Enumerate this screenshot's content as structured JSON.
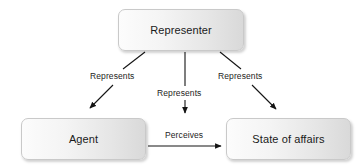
{
  "diagram": {
    "background_color": "#ffffff",
    "node_fill_start": "#fcfcfc",
    "node_fill_end": "#d9d9d9",
    "node_border_color": "#c9c9c9",
    "edge_color": "#1a1a1a",
    "text_color": "#1a1a1a",
    "nodes": [
      {
        "id": "representer",
        "label": "Representer"
      },
      {
        "id": "agent",
        "label": "Agent"
      },
      {
        "id": "state",
        "label": "State of affairs"
      }
    ],
    "edges": [
      {
        "id": "representer-agent",
        "label": "Represents",
        "from": "representer",
        "to": "agent",
        "style": "diagonal-left"
      },
      {
        "id": "representer-perception",
        "label": "Represents",
        "from": "representer",
        "to": "perceives-relation",
        "style": "vertical"
      },
      {
        "id": "representer-state",
        "label": "Represents",
        "from": "representer",
        "to": "state",
        "style": "diagonal-right"
      },
      {
        "id": "agent-state",
        "label": "Perceives",
        "from": "agent",
        "to": "state",
        "style": "horizontal"
      }
    ]
  }
}
